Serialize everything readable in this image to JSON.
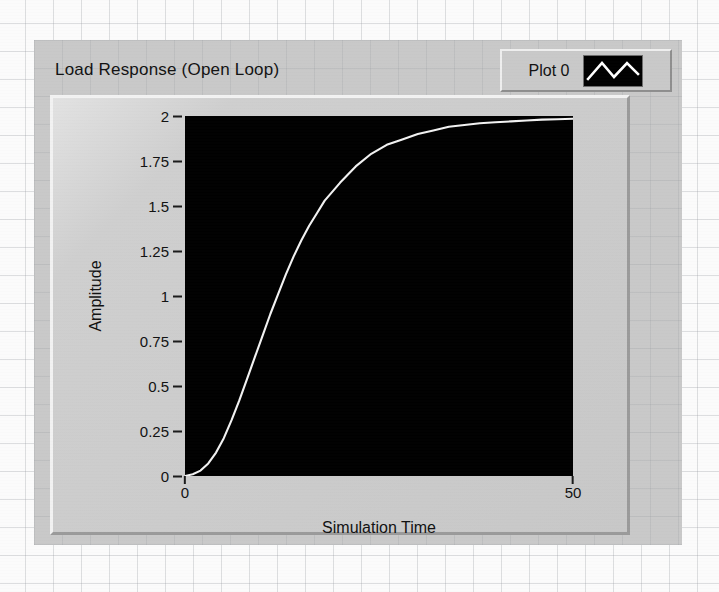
{
  "window": {
    "title": "Load Response (Open Loop)",
    "panel_color": "#c9c9c9",
    "plot_background": "#000000",
    "trace_color": "#f2f2f2"
  },
  "legend": {
    "plot_label": "Plot 0",
    "swatch_icon": "zigzag-line-icon"
  },
  "chart_data": {
    "type": "line",
    "title": "Load Response (Open Loop)",
    "xlabel": "Simulation Time",
    "ylabel": "Amplitude",
    "xlim": [
      0,
      50
    ],
    "ylim": [
      0,
      2
    ],
    "grid": false,
    "legend_position": "top-right",
    "xticks": [
      0,
      50
    ],
    "xtick_labels": [
      "0",
      "50"
    ],
    "yticks": [
      0,
      0.25,
      0.5,
      0.75,
      1,
      1.25,
      1.5,
      1.75,
      2
    ],
    "ytick_labels": [
      "0",
      "0.25",
      "0.5",
      "0.75",
      "1",
      "1.25",
      "1.5",
      "1.75",
      "2"
    ],
    "series": [
      {
        "name": "Plot 0",
        "color": "#f2f2f2",
        "x": [
          0,
          1,
          2,
          3,
          4,
          5,
          6,
          7,
          8,
          9,
          10,
          11,
          12,
          13,
          14,
          15,
          16,
          17,
          18,
          19,
          20,
          22,
          24,
          26,
          28,
          30,
          32,
          34,
          36,
          38,
          40,
          42,
          44,
          46,
          48,
          50
        ],
        "values": [
          0.0,
          0.01,
          0.03,
          0.07,
          0.13,
          0.21,
          0.31,
          0.42,
          0.54,
          0.66,
          0.78,
          0.9,
          1.01,
          1.12,
          1.22,
          1.31,
          1.39,
          1.46,
          1.53,
          1.58,
          1.63,
          1.72,
          1.79,
          1.84,
          1.87,
          1.9,
          1.92,
          1.94,
          1.95,
          1.96,
          1.965,
          1.97,
          1.975,
          1.98,
          1.982,
          1.985
        ]
      }
    ]
  }
}
